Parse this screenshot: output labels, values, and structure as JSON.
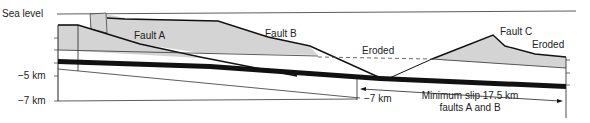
{
  "axis": {
    "sea_level": "Sea level",
    "depth_5": "−5 km",
    "depth_7": "−7 km",
    "depth_7_marker": "−7 km"
  },
  "labels": {
    "fault_a": "Fault A",
    "fault_b": "Fault B",
    "fault_c": "Fault C",
    "eroded_center": "Eroded",
    "eroded_right": "Eroded"
  },
  "annotation": {
    "slip_line1": "Minimum slip 17.5 km",
    "slip_line2": "faults A and B"
  },
  "colors": {
    "fill_gray": "#d4d4d4",
    "line": "#1a1a1a",
    "background": "#ffffff"
  }
}
